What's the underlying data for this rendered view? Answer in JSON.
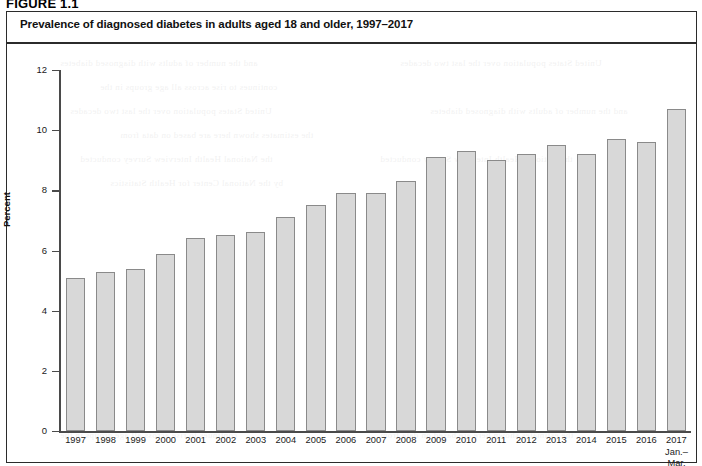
{
  "figure": {
    "number": "FIGURE 1.1",
    "title": "Prevalence of diagnosed diabetes in adults aged 18 and older, 1997–2017"
  },
  "chart_data": {
    "type": "bar",
    "title": "Prevalence of diagnosed diabetes in adults aged 18 and older, 1997–2017",
    "xlabel": "",
    "ylabel": "Percent",
    "ylim": [
      0,
      12
    ],
    "yticks": [
      0,
      2,
      4,
      6,
      8,
      10,
      12
    ],
    "grid": false,
    "legend": "none",
    "bar_fill_color": "#d8d8d8",
    "bar_border_color": "#8a8a8a",
    "categories": [
      "1997",
      "1998",
      "1999",
      "2000",
      "2001",
      "2002",
      "2003",
      "2004",
      "2005",
      "2006",
      "2007",
      "2008",
      "2009",
      "2010",
      "2011",
      "2012",
      "2013",
      "2014",
      "2015",
      "2016",
      "2017\nJan.–\nMar."
    ],
    "values": [
      5.1,
      5.3,
      5.4,
      5.9,
      6.4,
      6.5,
      6.6,
      7.1,
      7.5,
      7.9,
      7.9,
      8.3,
      9.1,
      9.3,
      9.0,
      9.2,
      9.5,
      9.2,
      9.7,
      9.6,
      10.7
    ]
  },
  "bleed_text": [
    "and the number of adults with diagnosed diabetes",
    "continues to rise across all age groups in the",
    "United States population over the last two decades",
    "the estimates shown here are based on data from",
    "the National Health Interview Survey conducted",
    "by the National Center for Health Statistics"
  ]
}
